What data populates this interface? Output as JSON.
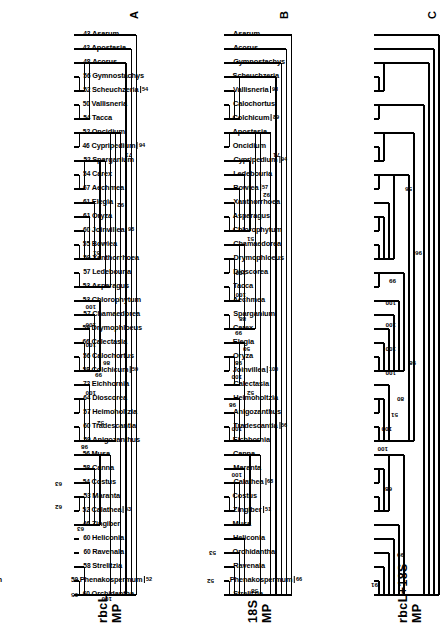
{
  "figure": {
    "orientation": "rotated-90",
    "panels": [
      {
        "letter": "A",
        "title_line1": "rbcL",
        "title_line2": "MP",
        "tips": [
          {
            "num": "45",
            "name": "Strelitzia",
            "brk": ""
          },
          {
            "num": "46",
            "name": "Phenakospermum",
            "brk": ""
          },
          {
            "num": "45",
            "name": "Ravenala",
            "brk": ""
          },
          {
            "num": "43",
            "name": "Orchidantha",
            "brk": ""
          },
          {
            "num": "43",
            "name": "Heliconia",
            "brk": ""
          },
          {
            "num": "41",
            "name": "Canna",
            "brk": ""
          },
          {
            "num": "41",
            "name": "Maranta",
            "brk": ""
          },
          {
            "num": "42",
            "name": "Calathea",
            "brk": ""
          },
          {
            "num": "42",
            "name": "Costus",
            "brk": ""
          },
          {
            "num": "42",
            "name": "Musa",
            "brk": ""
          },
          {
            "num": "39",
            "name": "Zingiber",
            "brk": ""
          },
          {
            "num": "42",
            "name": "Eichhornia",
            "brk": ""
          },
          {
            "num": "44",
            "name": "Tradescantia",
            "brk": "62"
          },
          {
            "num": "42",
            "name": "Anigozanthus",
            "brk": ""
          },
          {
            "num": "44",
            "name": "Heimoholtzia",
            "brk": "63"
          },
          {
            "num": "43",
            "name": "Calectasia",
            "brk": ""
          },
          {
            "num": "47",
            "name": "Joinvillea",
            "brk": "100"
          },
          {
            "num": "45",
            "name": "Oryza",
            "brk": ""
          },
          {
            "num": "45",
            "name": "Elegia",
            "brk": ""
          },
          {
            "num": "33",
            "name": "Carex",
            "brk": ""
          },
          {
            "num": "43",
            "name": "Sparganium",
            "brk": ""
          },
          {
            "num": "43",
            "name": "Aechmea",
            "brk": ""
          },
          {
            "num": "44",
            "name": "Drymophloeus",
            "brk": ""
          },
          {
            "num": "45",
            "name": "Chamaedorea",
            "brk": ""
          },
          {
            "num": "41",
            "name": "Chlorophytum",
            "brk": ""
          },
          {
            "num": "43",
            "name": "Ledebouria",
            "brk": "56"
          },
          {
            "num": "42",
            "name": "Bowiea",
            "brk": ""
          },
          {
            "num": "44",
            "name": "Xanthorrhoea",
            "brk": ""
          },
          {
            "num": "41",
            "name": "Asparagus",
            "brk": ""
          },
          {
            "num": "41",
            "name": "Apostasia",
            "brk": "56"
          },
          {
            "num": "42",
            "name": "Oncidium",
            "brk": ""
          },
          {
            "num": "44",
            "name": "Cypripedium",
            "brk": ""
          },
          {
            "num": "44",
            "name": "Tacca",
            "brk": ""
          },
          {
            "num": "46",
            "name": "Dioscorea",
            "brk": ""
          },
          {
            "num": "45",
            "name": "Colchicum",
            "brk": ""
          },
          {
            "num": "45",
            "name": "Calochortus",
            "brk": ""
          },
          {
            "num": "45",
            "name": "Vallisneria",
            "brk": ""
          },
          {
            "num": "46",
            "name": "Scheuchzeria",
            "brk": "63"
          },
          {
            "num": "44",
            "name": "Gymnostachys",
            "brk": ""
          },
          {
            "num": "46",
            "name": "Acorus",
            "brk": ""
          },
          {
            "num": "48",
            "name": "Asarum",
            "brk": ""
          }
        ],
        "node_numbers": [
          "95",
          "63",
          "100",
          "62",
          "63",
          "98",
          "52",
          "100",
          "99",
          "86",
          "100",
          "100",
          "100",
          "51",
          "92",
          "71"
        ]
      },
      {
        "letter": "B",
        "title_line1": "18S",
        "title_line2": "MP",
        "tips": [
          {
            "num": "60",
            "name": "Orchidantha",
            "brk": ""
          },
          {
            "num": "59",
            "name": "Phenakospermum",
            "brk": "52"
          },
          {
            "num": "58",
            "name": "Strelitzia",
            "brk": ""
          },
          {
            "num": "60",
            "name": "Ravenala",
            "brk": ""
          },
          {
            "num": "60",
            "name": "Heliconia",
            "brk": ""
          },
          {
            "num": "46",
            "name": "Zingiber",
            "brk": ""
          },
          {
            "num": "52",
            "name": "Calathea",
            "brk": "53"
          },
          {
            "num": "53",
            "name": "Maranta",
            "brk": ""
          },
          {
            "num": "54",
            "name": "Costus",
            "brk": ""
          },
          {
            "num": "58",
            "name": "Canna",
            "brk": ""
          },
          {
            "num": "56",
            "name": "Musa",
            "brk": ""
          },
          {
            "num": "59",
            "name": "Anigozanthus",
            "brk": ""
          },
          {
            "num": "60",
            "name": "Tradescantia",
            "brk": ""
          },
          {
            "num": "57",
            "name": "Heimoholtzia",
            "brk": ""
          },
          {
            "num": "64",
            "name": "Dioscorea",
            "brk": ""
          },
          {
            "num": "72",
            "name": "Eichhornia",
            "brk": ""
          },
          {
            "num": "58",
            "name": "Colchicum",
            "brk": "59"
          },
          {
            "num": "56",
            "name": "Calochortus",
            "brk": ""
          },
          {
            "num": "66",
            "name": "Calectasia",
            "brk": ""
          },
          {
            "num": "59",
            "name": "Drymophloeus",
            "brk": ""
          },
          {
            "num": "57",
            "name": "Chamaedorea",
            "brk": ""
          },
          {
            "num": "53",
            "name": "Chlorophytum",
            "brk": ""
          },
          {
            "num": "53",
            "name": "Asparagus",
            "brk": ""
          },
          {
            "num": "57",
            "name": "Ledebouria",
            "brk": ""
          },
          {
            "num": "59",
            "name": "Xanthorrhoea",
            "brk": ""
          },
          {
            "num": "55",
            "name": "Bowiea",
            "brk": ""
          },
          {
            "num": "60",
            "name": "Joinvillea",
            "brk": "98"
          },
          {
            "num": "61",
            "name": "Oryza",
            "brk": ""
          },
          {
            "num": "61",
            "name": "Elegia",
            "brk": ""
          },
          {
            "num": "67",
            "name": "Aechmea",
            "brk": ""
          },
          {
            "num": "54",
            "name": "Carex",
            "brk": ""
          },
          {
            "num": "52",
            "name": "Sparganium",
            "brk": ""
          },
          {
            "num": "46",
            "name": "Cypripedium",
            "brk": "94"
          },
          {
            "num": "52",
            "name": "Oncidium",
            "brk": ""
          },
          {
            "num": "54",
            "name": "Tacca",
            "brk": ""
          },
          {
            "num": "50",
            "name": "Vallisneria",
            "brk": ""
          },
          {
            "num": "52",
            "name": "Scheuchzeria",
            "brk": "54"
          },
          {
            "num": "56",
            "name": "Gymnostachys",
            "brk": ""
          },
          {
            "num": "48",
            "name": "Acorus",
            "brk": ""
          },
          {
            "num": "42",
            "name": "Apostasia",
            "brk": ""
          },
          {
            "num": "43",
            "name": "Asarum",
            "brk": ""
          }
        ],
        "node_numbers": [
          "52",
          "53",
          "58",
          "100",
          "100",
          "98",
          "52",
          "100",
          "98",
          "50",
          "99",
          "88",
          "100",
          "100",
          "51",
          "92",
          "71"
        ]
      },
      {
        "letter": "C",
        "title_line1": "rbcL+18S",
        "title_line2": "MP",
        "tips": [
          {
            "num": "",
            "name": "Strelitzia",
            "brk": ""
          },
          {
            "num": "",
            "name": "Phenakospermum",
            "brk": "66"
          },
          {
            "num": "",
            "name": "Ravenala",
            "brk": ""
          },
          {
            "num": "",
            "name": "Orchidantha",
            "brk": ""
          },
          {
            "num": "",
            "name": "Heliconia",
            "brk": ""
          },
          {
            "num": "",
            "name": "Musa",
            "brk": ""
          },
          {
            "num": "",
            "name": "Zingiber",
            "brk": "51"
          },
          {
            "num": "",
            "name": "Costus",
            "brk": ""
          },
          {
            "num": "",
            "name": "Calathea",
            "brk": "68"
          },
          {
            "num": "",
            "name": "Maranta",
            "brk": ""
          },
          {
            "num": "",
            "name": "Canna",
            "brk": ""
          },
          {
            "num": "",
            "name": "Eichhornia",
            "brk": ""
          },
          {
            "num": "",
            "name": "Tradescantia",
            "brk": "56"
          },
          {
            "num": "",
            "name": "Anigozanthus",
            "brk": ""
          },
          {
            "num": "",
            "name": "Heimoholtzia",
            "brk": ""
          },
          {
            "num": "",
            "name": "Calectasia",
            "brk": ""
          },
          {
            "num": "",
            "name": "Joinvillea",
            "brk": "100"
          },
          {
            "num": "",
            "name": "Oryza",
            "brk": ""
          },
          {
            "num": "",
            "name": "Elegia",
            "brk": ""
          },
          {
            "num": "",
            "name": "Carex",
            "brk": ""
          },
          {
            "num": "",
            "name": "Sparganium",
            "brk": ""
          },
          {
            "num": "",
            "name": "Aechmea",
            "brk": ""
          },
          {
            "num": "",
            "name": "Tacca",
            "brk": ""
          },
          {
            "num": "",
            "name": "Dioscorea",
            "brk": ""
          },
          {
            "num": "",
            "name": "Drymophloeus",
            "brk": ""
          },
          {
            "num": "",
            "name": "Chamaedorea",
            "brk": ""
          },
          {
            "num": "",
            "name": "Chlorophytum",
            "brk": ""
          },
          {
            "num": "",
            "name": "Asparagus",
            "brk": ""
          },
          {
            "num": "",
            "name": "Xanthorrhoea",
            "brk": ""
          },
          {
            "num": "",
            "name": "Bowiea",
            "brk": "57"
          },
          {
            "num": "",
            "name": "Ledebouria",
            "brk": ""
          },
          {
            "num": "",
            "name": "Cypripedium",
            "brk": "94"
          },
          {
            "num": "",
            "name": "Oncidium",
            "brk": ""
          },
          {
            "num": "",
            "name": "Apostasia",
            "brk": ""
          },
          {
            "num": "",
            "name": "Colchicum",
            "brk": "89"
          },
          {
            "num": "",
            "name": "Calochortus",
            "brk": ""
          },
          {
            "num": "",
            "name": "Vallisneria",
            "brk": "93"
          },
          {
            "num": "",
            "name": "Scheuchzeria",
            "brk": ""
          },
          {
            "num": "",
            "name": "Gymnostachys",
            "brk": ""
          },
          {
            "num": "",
            "name": "Acorus",
            "brk": ""
          },
          {
            "num": "",
            "name": "Asarum",
            "brk": ""
          }
        ],
        "node_numbers": [
          "91",
          "99",
          "68",
          "100",
          "100",
          "51",
          "80",
          "100",
          "100",
          "100",
          "100",
          "99",
          "98",
          "96",
          "56"
        ]
      }
    ]
  }
}
